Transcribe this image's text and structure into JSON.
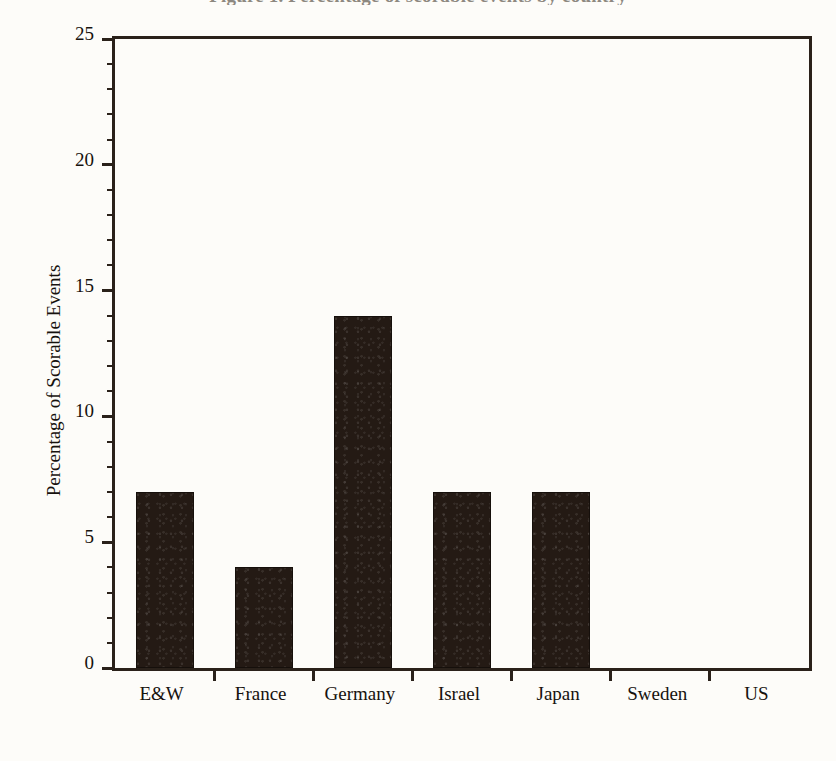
{
  "figure": {
    "clipped_title": "Figure 1. Percentage of scorable events by country",
    "background_color": "#fdfcf9",
    "bar_color": "#241a14",
    "axis_color": "#2a211a"
  },
  "chart_data": {
    "type": "bar",
    "title": "",
    "xlabel": "",
    "ylabel": "Percentage of Scorable Events",
    "categories": [
      "E&W",
      "France",
      "Germany",
      "Israel",
      "Japan",
      "Sweden",
      "US"
    ],
    "values": [
      7,
      4,
      14,
      7,
      7,
      0,
      0
    ],
    "ylim": [
      0,
      25
    ],
    "ytick_labels": [
      "0",
      "5",
      "10",
      "15",
      "20",
      "25"
    ],
    "ytick_values": [
      0,
      5,
      10,
      15,
      20,
      25
    ],
    "ytick_minor_step": 1,
    "grid": false,
    "legend": false,
    "series": [
      {
        "name": "Percentage of Scorable Events",
        "values": [
          7,
          4,
          14,
          7,
          7,
          0,
          0
        ]
      }
    ]
  }
}
